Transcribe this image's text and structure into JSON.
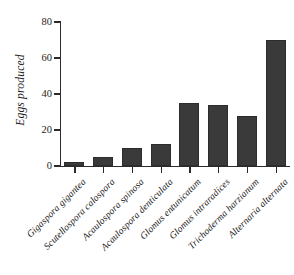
{
  "chart_data": {
    "type": "bar",
    "title": "",
    "xlabel": "",
    "ylabel": "Eggs produced",
    "ylim": [
      0,
      80
    ],
    "yticks": [
      0,
      20,
      40,
      60,
      80
    ],
    "grid": false,
    "legend": null,
    "bar_color": "#3a3a3a",
    "axis_color": "#2b2b2b",
    "categories": [
      "Gigaspora gigantea",
      "Scutellospora calospora",
      "Acaulospora spinosa",
      "Acaulospora denticulata",
      "Glomus entunicatum",
      "Glomus intraradices",
      "Trichoderma harzianum",
      "Alternaria alternata"
    ],
    "values": [
      2,
      5,
      10,
      12,
      35,
      34,
      28,
      70
    ]
  }
}
